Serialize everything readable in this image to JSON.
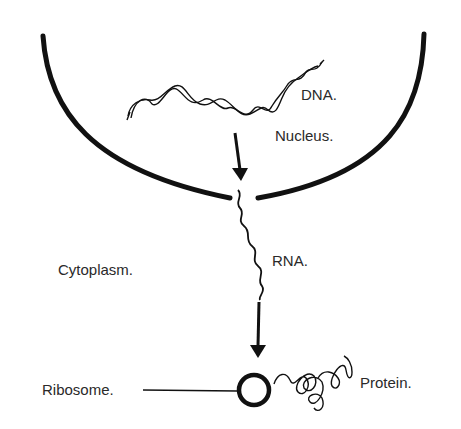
{
  "diagram": {
    "labels": {
      "dna": "DNA.",
      "nucleus": "Nucleus.",
      "rna": "RNA.",
      "cytoplasm": "Cytoplasm.",
      "ribosome": "Ribosome.",
      "protein": "Protein."
    },
    "colors": {
      "ink": "#111111",
      "text": "#2a2a2a",
      "background": "#ffffff"
    },
    "flow": [
      "DNA",
      "RNA",
      "Ribosome",
      "Protein"
    ]
  }
}
